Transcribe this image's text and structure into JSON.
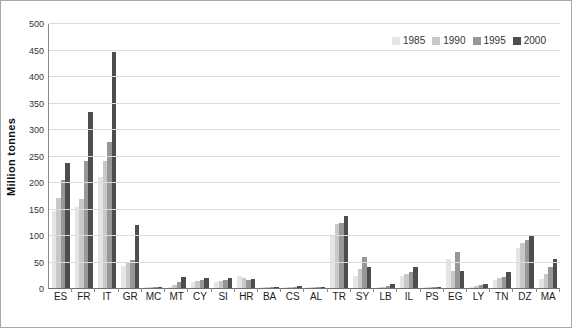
{
  "chart_data": {
    "type": "bar",
    "title": "",
    "xlabel": "",
    "ylabel": "Million tonnes",
    "ylim": [
      0,
      500
    ],
    "ytick_step": 50,
    "grid": true,
    "legend_position": "top-right-inside",
    "categories": [
      "ES",
      "FR",
      "IT",
      "GR",
      "MC",
      "MT",
      "CY",
      "SI",
      "HR",
      "BA",
      "CS",
      "AL",
      "TR",
      "SY",
      "LB",
      "IL",
      "PS",
      "EG",
      "LY",
      "TN",
      "DZ",
      "MA"
    ],
    "series": [
      {
        "name": "1985",
        "color": "#e5e5e5",
        "values": [
          145,
          152,
          210,
          42,
          1,
          2,
          12,
          12,
          22,
          1,
          1,
          1,
          100,
          22,
          1,
          22,
          1,
          55,
          1,
          16,
          75,
          17
        ]
      },
      {
        "name": "1990",
        "color": "#c8c8c8",
        "values": [
          170,
          168,
          240,
          47,
          1,
          5,
          13,
          14,
          18,
          1,
          2,
          1,
          120,
          35,
          2,
          27,
          1,
          33,
          3,
          18,
          85,
          27
        ]
      },
      {
        "name": "1995",
        "color": "#979797",
        "values": [
          203,
          240,
          275,
          53,
          1,
          11,
          16,
          15,
          15,
          1,
          2,
          2,
          122,
          58,
          4,
          31,
          1,
          68,
          6,
          21,
          90,
          40
        ]
      },
      {
        "name": "2000",
        "color": "#4d4d4d",
        "values": [
          235,
          332,
          445,
          118,
          1,
          21,
          19,
          19,
          17,
          2,
          3,
          2,
          135,
          40,
          8,
          40,
          1,
          33,
          8,
          30,
          98,
          55
        ]
      }
    ]
  },
  "axes": {
    "y_ticks": [
      "0",
      "50",
      "100",
      "150",
      "200",
      "250",
      "300",
      "350",
      "400",
      "450",
      "500"
    ]
  },
  "legend": {
    "items": [
      "1985",
      "1990",
      "1995",
      "2000"
    ]
  }
}
